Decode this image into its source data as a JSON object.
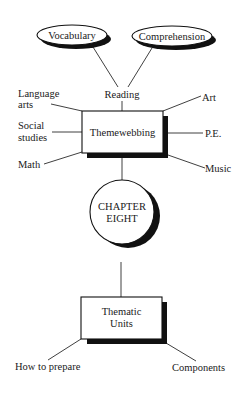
{
  "diagram": {
    "top_nodes": {
      "vocabulary": "Vocabulary",
      "comprehension": "Comprehension"
    },
    "central_node": "Themewebbing",
    "branches": {
      "reading": "Reading",
      "language_arts": [
        "Language",
        "arts"
      ],
      "social_studies": [
        "Social",
        "studies"
      ],
      "math": "Math",
      "art": "Art",
      "pe": "P.E.",
      "music": "Music"
    },
    "chapter_node": [
      "CHAPTER",
      "EIGHT"
    ],
    "lower_node": [
      "Thematic",
      "Units"
    ],
    "lower_branches": {
      "how_to_prepare": "How to prepare",
      "components": "Components"
    }
  },
  "colors": {
    "ink": "#1a1a1a",
    "background": "#ffffff"
  }
}
